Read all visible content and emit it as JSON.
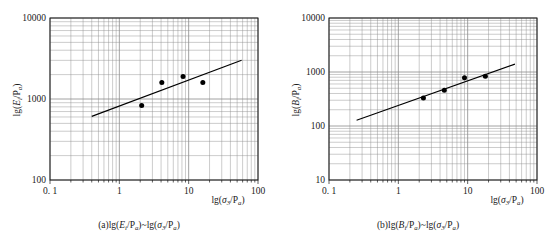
{
  "figure": {
    "panels": [
      {
        "id": "a",
        "caption": "(a)lg(Ei/Pa)~lg(σ3/Pa)",
        "caption_parts": {
          "prefix": "(a)lg(",
          "var": "E",
          "var_sub": "i",
          "over": "/P",
          "over_sub": "a",
          "mid": ")~lg(",
          "x_var": "σ",
          "x_sub": "3",
          "x_over": "/P",
          "x_over_sub": "a",
          "suffix": ")"
        },
        "y_axis": {
          "label": "lg(Ei/Pa)",
          "label_parts": {
            "prefix": "lg(",
            "var": "E",
            "sub": "i",
            "mid": "/P",
            "sub2": "a",
            "suffix": ")"
          },
          "ticks": [
            "100",
            "1000",
            "10000"
          ],
          "min": 100,
          "max": 10000,
          "decades": 2,
          "scale": "log"
        },
        "x_axis": {
          "label": "lg(σ3/Pa)",
          "label_parts": {
            "prefix": "lg(",
            "var": "σ",
            "sub": "3",
            "mid": "/P",
            "sub2": "a",
            "suffix": ")"
          },
          "ticks": [
            "0. 1",
            "1",
            "10",
            "100"
          ],
          "min": 0.1,
          "max": 100,
          "decades": 3,
          "scale": "log"
        }
      },
      {
        "id": "b",
        "caption": "(b)lg(Bi/Pa)~lg(σ3/Pa)",
        "caption_parts": {
          "prefix": "(b)lg(",
          "var": "B",
          "var_sub": "i",
          "over": "/P",
          "over_sub": "a",
          "mid": ")~lg(",
          "x_var": "σ",
          "x_sub": "3",
          "x_over": "/P",
          "x_over_sub": "a",
          "suffix": ")"
        },
        "y_axis": {
          "label": "lg(Bi/Pa)",
          "label_parts": {
            "prefix": "lg(",
            "var": "B",
            "sub": "i",
            "mid": "/P",
            "sub2": "a",
            "suffix": ")"
          },
          "ticks": [
            "10",
            "100",
            "1000",
            "10000"
          ],
          "min": 10,
          "max": 10000,
          "decades": 3,
          "scale": "log"
        },
        "x_axis": {
          "label": "lg(σ3/Pa)",
          "label_parts": {
            "prefix": "lg(",
            "var": "σ",
            "sub": "3",
            "mid": "/P",
            "sub2": "a",
            "suffix": ")"
          },
          "ticks": [
            "0. 1",
            "1",
            "10",
            "100"
          ],
          "min": 0.1,
          "max": 100,
          "decades": 3,
          "scale": "log"
        }
      }
    ]
  },
  "chart_data": [
    {
      "type": "scatter",
      "panel": "a",
      "title": "(a)lg(Ei/Pa)~lg(σ3/Pa)",
      "xlabel": "lg(σ3/Pa)",
      "ylabel": "lg(Ei/Pa)",
      "xscale": "log",
      "yscale": "log",
      "xlim": [
        0.1,
        100
      ],
      "ylim": [
        100,
        10000
      ],
      "grid": true,
      "legend": null,
      "series": [
        {
          "name": "data points",
          "marker": "filled-circle",
          "color": "#000000",
          "x": [
            2.1,
            4.1,
            8.3,
            16.0
          ],
          "y": [
            830,
            1600,
            1900,
            1600
          ]
        },
        {
          "name": "fitted line",
          "type": "line",
          "color": "#000000",
          "x": [
            0.4,
            58.0
          ],
          "y": [
            610,
            3000
          ]
        }
      ]
    },
    {
      "type": "scatter",
      "panel": "b",
      "title": "(b)lg(Bi/Pa)~lg(σ3/Pa)",
      "xlabel": "lg(σ3/Pa)",
      "ylabel": "lg(Bi/Pa)",
      "xscale": "log",
      "yscale": "log",
      "xlim": [
        0.1,
        100
      ],
      "ylim": [
        10,
        10000
      ],
      "grid": true,
      "legend": null,
      "series": [
        {
          "name": "data points",
          "marker": "filled-circle",
          "color": "#000000",
          "x": [
            2.3,
            4.6,
            9.0,
            18.0
          ],
          "y": [
            330,
            460,
            780,
            830
          ]
        },
        {
          "name": "fitted line",
          "type": "line",
          "color": "#000000",
          "x": [
            0.25,
            48.0
          ],
          "y": [
            128,
            1400
          ]
        }
      ]
    }
  ],
  "style": {
    "grid_color": "#8c8c8c",
    "axis_color": "#1a1a1a",
    "marker_color": "#000000",
    "background": "#ffffff"
  }
}
